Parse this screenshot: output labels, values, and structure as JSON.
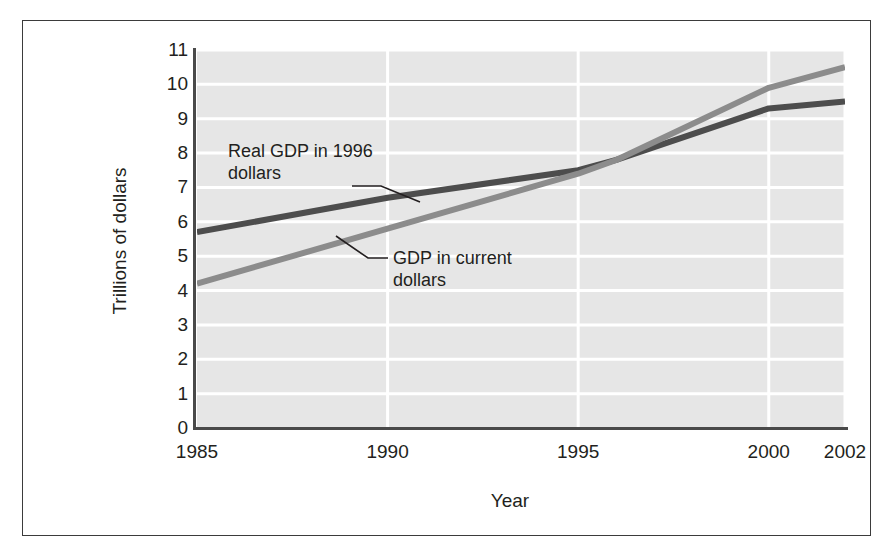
{
  "chart_data": {
    "type": "line",
    "title": "",
    "xlabel": "Year",
    "ylabel": "Trillions of dollars",
    "xlim": [
      1985,
      2002
    ],
    "ylim": [
      0,
      11
    ],
    "grid": true,
    "legend_position": "inline-annotations",
    "xticks": [
      1985,
      1990,
      1995,
      2000,
      2002
    ],
    "xtick_labels": [
      "1985",
      "1990",
      "1995",
      "2000",
      "2002"
    ],
    "yticks": [
      0,
      1,
      2,
      3,
      4,
      5,
      6,
      7,
      8,
      9,
      10,
      11
    ],
    "ytick_labels": [
      "0",
      "1",
      "2",
      "3",
      "4",
      "5",
      "6",
      "7",
      "8",
      "9",
      "10",
      "11"
    ],
    "series": [
      {
        "name": "Real GDP in 1996 dollars",
        "color": "#4d4d4d",
        "x": [
          1985,
          1990,
          1995,
          1996,
          2000,
          2002
        ],
        "values": [
          5.7,
          6.7,
          7.5,
          7.8,
          9.3,
          9.5
        ]
      },
      {
        "name": "GDP in current dollars",
        "color": "#8c8c8c",
        "x": [
          1985,
          1990,
          1995,
          1996,
          2000,
          2002
        ],
        "values": [
          4.2,
          5.8,
          7.4,
          7.8,
          9.9,
          10.5
        ]
      }
    ],
    "annotations": [
      {
        "id": "real-gdp",
        "text": "Real GDP in 1996\ndollars",
        "points_to_series": "Real GDP in 1996 dollars"
      },
      {
        "id": "current-gdp",
        "text": "GDP in current\ndollars",
        "points_to_series": "GDP in current dollars"
      }
    ]
  },
  "axes": {
    "y_title": "Trillions of dollars",
    "x_title": "Year"
  },
  "annotations": {
    "real_gdp_label": "Real GDP in 1996\ndollars",
    "current_gdp_label": "GDP in current\ndollars"
  },
  "colors": {
    "plot_background": "#e6e6e6",
    "gridline": "#ffffff",
    "axis": "#4a4a4a",
    "frame": "#3b3b3b",
    "real_gdp_line": "#4d4d4d",
    "current_gdp_line": "#8c8c8c",
    "text": "#231f20"
  }
}
